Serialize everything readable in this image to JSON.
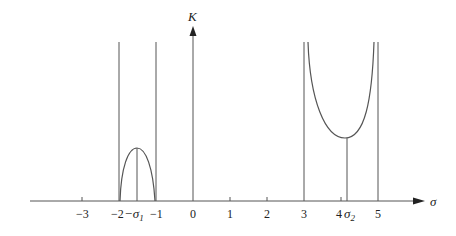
{
  "diagram": {
    "title": "",
    "type": "root-locus-sketch",
    "axes": {
      "x_label": "σ",
      "y_label": "K",
      "x_ticks": [
        {
          "value": -3,
          "label": "−3"
        },
        {
          "value": -2,
          "label": "−2"
        },
        {
          "value": -1,
          "label": "−1"
        },
        {
          "value": 0,
          "label": "0"
        },
        {
          "value": 1,
          "label": "1"
        },
        {
          "value": 2,
          "label": "2"
        },
        {
          "value": 3,
          "label": "3"
        },
        {
          "value": 4,
          "label": "4"
        },
        {
          "value": 5,
          "label": "5"
        }
      ]
    },
    "special_points": {
      "sigma1": {
        "label": "−σ",
        "subscript": "1",
        "approx_value": -1.5
      },
      "sigma2": {
        "label": "σ",
        "subscript": "2",
        "approx_value": 4.15
      }
    },
    "vertical_lines_at": [
      -2,
      -1,
      0,
      3,
      5
    ],
    "curves": [
      {
        "name": "left-arch",
        "from": -2,
        "to": -1,
        "peak_at": "−σ1",
        "shape": "cap (maximum)"
      },
      {
        "name": "right-cup",
        "from": 3,
        "to": 5,
        "min_at": "σ2",
        "shape": "cup (minimum)"
      }
    ],
    "colors": {
      "line": "#555555",
      "text": "#222222",
      "background": "#ffffff"
    }
  }
}
